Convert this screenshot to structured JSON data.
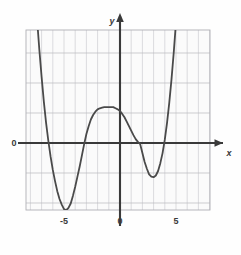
{
  "figure": {
    "background_color": "#fefefe",
    "plot_area_fill": "#fbfbfb",
    "grid_color": "#b9b9bd",
    "grid_minor_color": "#cfcfd4",
    "axis_color": "#3a3a3a",
    "curve_color": "#4a4a4a",
    "origin_label": "0",
    "x_axis_label": "x",
    "y_axis_label": "y"
  },
  "chart_data": {
    "type": "line",
    "title": "",
    "xlabel": "x",
    "ylabel": "y",
    "grid": true,
    "legend": "none",
    "xlim": [
      -8.4,
      8.0
    ],
    "ylim": [
      -7.5,
      11.2
    ],
    "xticks": [
      -5,
      0,
      5
    ],
    "xtick_labels": [
      "-5",
      "0",
      "5"
    ],
    "yticks": [],
    "ytick_labels": [],
    "x_major_step": 1,
    "y_major_step": 2.7,
    "annotations": [
      "0"
    ],
    "series": [
      {
        "name": "quartic",
        "roots": [
          -6.5,
          -3.2,
          1.8,
          4.2
        ],
        "local_minima": [
          [
            -5.0,
            -6.0
          ],
          [
            3.0,
            -3.0
          ]
        ],
        "local_maxima": [
          [
            -0.3,
            3.0
          ]
        ],
        "x": [
          -7.4,
          -7.2,
          -7.0,
          -6.8,
          -6.6,
          -6.4,
          -6.2,
          -6.0,
          -5.8,
          -5.6,
          -5.4,
          -5.2,
          -5.0,
          -4.8,
          -4.6,
          -4.4,
          -4.2,
          -4.0,
          -3.8,
          -3.6,
          -3.4,
          -3.2,
          -3.0,
          -2.8,
          -2.6,
          -2.4,
          -2.2,
          -2.0,
          -1.8,
          -1.6,
          -1.4,
          -1.2,
          -1.0,
          -0.8,
          -0.6,
          -0.4,
          -0.2,
          0.0,
          0.2,
          0.4,
          0.6,
          0.8,
          1.0,
          1.2,
          1.4,
          1.6,
          1.8,
          2.0,
          2.2,
          2.4,
          2.6,
          2.8,
          3.0,
          3.2,
          3.4,
          3.6,
          3.8,
          4.0,
          4.2,
          4.4,
          4.6,
          4.8,
          5.0,
          5.2
        ],
        "y": [
          11.0,
          8.3,
          5.9,
          3.7,
          1.8,
          0.2,
          -1.2,
          -2.4,
          -3.4,
          -4.3,
          -5.0,
          -5.5,
          -5.9,
          -6.0,
          -5.8,
          -5.4,
          -4.7,
          -3.9,
          -3.0,
          -2.1,
          -1.1,
          -0.1,
          0.8,
          1.5,
          2.1,
          2.5,
          2.8,
          3.0,
          3.1,
          3.15,
          3.2,
          3.2,
          3.2,
          3.2,
          3.2,
          3.1,
          3.0,
          2.85,
          2.6,
          2.3,
          1.9,
          1.5,
          1.1,
          0.7,
          0.35,
          0.1,
          -0.1,
          -0.9,
          -1.7,
          -2.3,
          -2.8,
          -3.0,
          -3.05,
          -2.9,
          -2.5,
          -1.8,
          -0.9,
          0.3,
          1.8,
          3.6,
          5.7,
          8.1,
          10.8,
          13.0
        ]
      }
    ]
  },
  "axes": {
    "x_axis": {
      "name": "x-axis",
      "arrow": "right"
    },
    "y_axis": {
      "name": "y-axis",
      "arrow": "up"
    }
  }
}
